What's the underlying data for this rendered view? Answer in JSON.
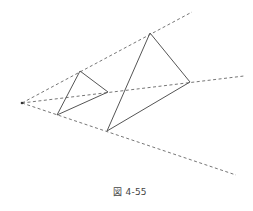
{
  "figure": {
    "caption": "図 4-55",
    "apex": {
      "x": 22,
      "y": 103
    },
    "rays": [
      {
        "name": "top",
        "end": {
          "x": 192,
          "y": 12
        }
      },
      {
        "name": "middle",
        "end": {
          "x": 244,
          "y": 76
        }
      },
      {
        "name": "bottom",
        "end": {
          "x": 236,
          "y": 175
        }
      }
    ],
    "small_triangle": [
      {
        "x": 80,
        "y": 71
      },
      {
        "x": 108,
        "y": 92
      },
      {
        "x": 57,
        "y": 115
      }
    ],
    "large_triangle": [
      {
        "x": 150,
        "y": 33
      },
      {
        "x": 190,
        "y": 82
      },
      {
        "x": 107,
        "y": 131
      }
    ],
    "colors": {
      "line": "#555555",
      "dashed": "#666666",
      "background": "#ffffff"
    }
  }
}
